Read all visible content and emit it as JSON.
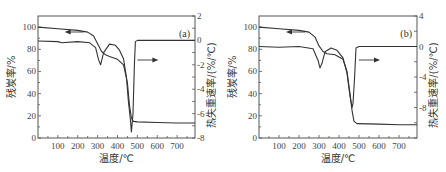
{
  "chart_data": [
    {
      "type": "line",
      "panel_label": "(a)",
      "xlabel": "温度/℃",
      "ylabel_left": "残炭率/%",
      "ylabel_right": "热失重速率/(%/℃)",
      "xlim": [
        0,
        790
      ],
      "ylim_left": [
        0,
        110
      ],
      "ylim_right": [
        -8,
        2
      ],
      "x_ticks": [
        100,
        200,
        300,
        400,
        500,
        600,
        700
      ],
      "y_ticks_left": [
        0,
        20,
        40,
        60,
        80,
        100
      ],
      "y_ticks_right": [
        -8,
        -6,
        -4,
        -2,
        0,
        2
      ],
      "grid": false,
      "series": [
        {
          "name": "TG (残炭率)",
          "axis": "left",
          "arrow": "left",
          "x": [
            0,
            100,
            200,
            250,
            280,
            300,
            320,
            340,
            360,
            400,
            430,
            450,
            460,
            470,
            480,
            500,
            600,
            700,
            790
          ],
          "y": [
            100,
            98.5,
            97,
            95.5,
            92,
            85,
            78,
            75,
            73.5,
            71,
            66,
            50,
            30,
            18,
            15,
            14.5,
            14,
            13.5,
            13.5
          ]
        },
        {
          "name": "DTG (热失重速率)",
          "axis": "right",
          "arrow": "right",
          "x": [
            0,
            100,
            120,
            200,
            260,
            290,
            305,
            315,
            330,
            360,
            390,
            410,
            430,
            445,
            455,
            465,
            470,
            478,
            485,
            490,
            500,
            600,
            700,
            790
          ],
          "y": [
            -0.05,
            -0.1,
            -0.2,
            -0.1,
            -0.2,
            -0.6,
            -1.6,
            -2.0,
            -1.0,
            -0.3,
            -0.4,
            -0.8,
            -1.5,
            -3.0,
            -5.0,
            -6.5,
            -7.5,
            -6.0,
            -2.0,
            -0.1,
            0,
            0,
            0,
            0
          ]
        }
      ]
    },
    {
      "type": "line",
      "panel_label": "(b)",
      "xlabel": "温度/℃",
      "ylabel_left": "残炭率/%",
      "ylabel_right": "热失重速率/(%/℃)",
      "xlim": [
        0,
        790
      ],
      "ylim_left": [
        0,
        110
      ],
      "ylim_right": [
        -12,
        4
      ],
      "x_ticks": [
        100,
        200,
        300,
        400,
        500,
        600,
        700
      ],
      "y_ticks_left": [
        0,
        20,
        40,
        60,
        80,
        100
      ],
      "y_ticks_right": [
        -8,
        -4,
        0,
        4
      ],
      "grid": false,
      "series": [
        {
          "name": "TG (残炭率)",
          "axis": "left",
          "arrow": "left",
          "x": [
            0,
            100,
            200,
            250,
            280,
            300,
            320,
            340,
            380,
            420,
            440,
            455,
            465,
            475,
            490,
            600,
            700,
            790
          ],
          "y": [
            100,
            98.5,
            97,
            95.5,
            91,
            83,
            78,
            76,
            75,
            71,
            60,
            40,
            25,
            15,
            13,
            12.5,
            12,
            12
          ]
        },
        {
          "name": "DTG (热失重速率)",
          "axis": "right",
          "arrow": "right",
          "x": [
            0,
            100,
            200,
            270,
            295,
            305,
            315,
            330,
            360,
            390,
            420,
            440,
            455,
            465,
            470,
            478,
            485,
            500,
            600,
            700,
            790
          ],
          "y": [
            0,
            -0.1,
            0,
            -0.3,
            -1.8,
            -2.8,
            -2.2,
            -0.7,
            -0.2,
            -0.5,
            -1.5,
            -3.5,
            -6.5,
            -8.0,
            -7.5,
            -4.0,
            -0.2,
            0,
            0,
            0,
            0
          ]
        }
      ]
    }
  ]
}
